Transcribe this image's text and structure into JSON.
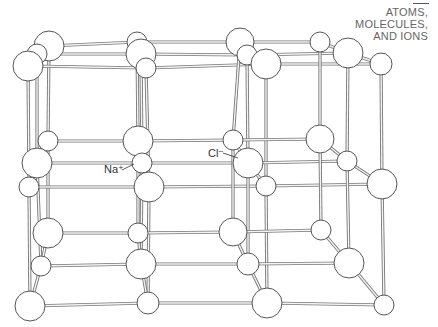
{
  "header": {
    "line1": "ATOMS,",
    "line2": "MOLECULES,",
    "line3": "AND IONS"
  },
  "labels": {
    "sodium": "Na⁺",
    "chloride": "Cl⁻"
  },
  "diagram": {
    "ions": [
      {
        "type": "Cl",
        "x": 49,
        "y": 46,
        "r": 15
      },
      {
        "type": "Na",
        "x": 37,
        "y": 54,
        "r": 10
      },
      {
        "type": "Cl",
        "x": 28,
        "y": 66,
        "r": 15
      },
      {
        "type": "Na",
        "x": 137,
        "y": 42,
        "r": 10
      },
      {
        "type": "Cl",
        "x": 141,
        "y": 54,
        "r": 15
      },
      {
        "type": "Na",
        "x": 146,
        "y": 68,
        "r": 10
      },
      {
        "type": "Cl",
        "x": 240,
        "y": 42,
        "r": 14
      },
      {
        "type": "Na",
        "x": 247,
        "y": 55,
        "r": 10
      },
      {
        "type": "Cl",
        "x": 266,
        "y": 64,
        "r": 15
      },
      {
        "type": "Na",
        "x": 320,
        "y": 42,
        "r": 10
      },
      {
        "type": "Cl",
        "x": 348,
        "y": 53,
        "r": 15
      },
      {
        "type": "Na",
        "x": 381,
        "y": 64,
        "r": 11
      },
      {
        "type": "Na",
        "x": 48,
        "y": 141,
        "r": 10
      },
      {
        "type": "Cl",
        "x": 37,
        "y": 163,
        "r": 15
      },
      {
        "type": "Na",
        "x": 29,
        "y": 187,
        "r": 10
      },
      {
        "type": "Cl",
        "x": 138,
        "y": 141,
        "r": 15
      },
      {
        "type": "Na",
        "x": 142,
        "y": 163,
        "r": 10
      },
      {
        "type": "Cl",
        "x": 149,
        "y": 187,
        "r": 15
      },
      {
        "type": "Na",
        "x": 233,
        "y": 140,
        "r": 10
      },
      {
        "type": "Cl",
        "x": 248,
        "y": 163,
        "r": 15
      },
      {
        "type": "Na",
        "x": 266,
        "y": 186,
        "r": 10
      },
      {
        "type": "Cl",
        "x": 320,
        "y": 139,
        "r": 14
      },
      {
        "type": "Na",
        "x": 347,
        "y": 161,
        "r": 10
      },
      {
        "type": "Cl",
        "x": 382,
        "y": 184,
        "r": 15
      },
      {
        "type": "Cl",
        "x": 48,
        "y": 233,
        "r": 15
      },
      {
        "type": "Na",
        "x": 41,
        "y": 266,
        "r": 10
      },
      {
        "type": "Cl",
        "x": 30,
        "y": 306,
        "r": 15
      },
      {
        "type": "Na",
        "x": 138,
        "y": 233,
        "r": 10
      },
      {
        "type": "Cl",
        "x": 141,
        "y": 264,
        "r": 15
      },
      {
        "type": "Na",
        "x": 148,
        "y": 303,
        "r": 11
      },
      {
        "type": "Cl",
        "x": 233,
        "y": 232,
        "r": 14
      },
      {
        "type": "Na",
        "x": 248,
        "y": 264,
        "r": 11
      },
      {
        "type": "Cl",
        "x": 267,
        "y": 303,
        "r": 15
      },
      {
        "type": "Na",
        "x": 321,
        "y": 230,
        "r": 10
      },
      {
        "type": "Cl",
        "x": 349,
        "y": 263,
        "r": 15
      },
      {
        "type": "Na",
        "x": 384,
        "y": 305,
        "r": 10
      }
    ]
  }
}
